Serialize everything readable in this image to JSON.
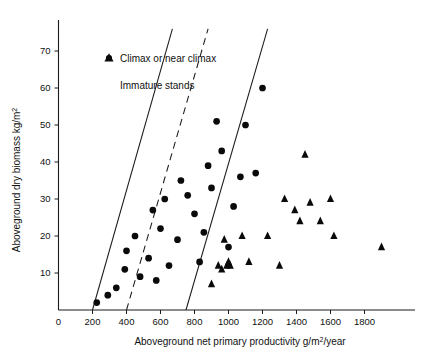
{
  "chart_data": {
    "type": "scatter",
    "title": "",
    "xlabel": "Aboveground net primary productivity g/m2/year",
    "xlabel_parts": {
      "pre": "Aboveground net primary productivity g/m",
      "sup": "2",
      "post": "/year"
    },
    "ylabel": "Aboveground dry biomass kg/m2",
    "ylabel_parts": {
      "pre": "Aboveground dry biomass kg/m",
      "sup": "2"
    },
    "xlim": [
      0,
      2000
    ],
    "ylim": [
      0,
      76
    ],
    "grid": false,
    "x_ticks": [
      0,
      200,
      400,
      600,
      800,
      1000,
      1200,
      1400,
      1600,
      1800
    ],
    "x_tick_labels": [
      "0",
      "200",
      "400",
      "600",
      "800",
      "1000",
      "1200",
      "1400",
      "1600",
      "1800"
    ],
    "y_ticks": [
      10,
      20,
      30,
      40,
      50,
      60,
      70
    ],
    "y_tick_labels": [
      "10",
      "20",
      "30",
      "40",
      "50",
      "60",
      "70"
    ],
    "legend_position": "upper-left-inside",
    "series": [
      {
        "name": "Climax or near climax",
        "marker": "circle",
        "color": "#0a0a0a",
        "points": [
          [
            225,
            2
          ],
          [
            290,
            4
          ],
          [
            340,
            6
          ],
          [
            390,
            11
          ],
          [
            400,
            16
          ],
          [
            450,
            20
          ],
          [
            480,
            9
          ],
          [
            530,
            14
          ],
          [
            555,
            27
          ],
          [
            575,
            8
          ],
          [
            600,
            22
          ],
          [
            625,
            30
          ],
          [
            650,
            12
          ],
          [
            700,
            19
          ],
          [
            720,
            35
          ],
          [
            760,
            31
          ],
          [
            800,
            26
          ],
          [
            830,
            13
          ],
          [
            855,
            21
          ],
          [
            880,
            39
          ],
          [
            900,
            33
          ],
          [
            930,
            51
          ],
          [
            960,
            43
          ],
          [
            1000,
            17
          ],
          [
            1030,
            28
          ],
          [
            1070,
            36
          ],
          [
            1100,
            50
          ],
          [
            1160,
            37
          ],
          [
            1200,
            60
          ]
        ]
      },
      {
        "name": "Immature stands",
        "marker": "triangle",
        "color": "#0a0a0a",
        "points": [
          [
            900,
            7
          ],
          [
            940,
            12
          ],
          [
            960,
            11
          ],
          [
            975,
            19
          ],
          [
            990,
            12
          ],
          [
            1000,
            13
          ],
          [
            1010,
            12
          ],
          [
            1080,
            20
          ],
          [
            1120,
            13
          ],
          [
            1230,
            20
          ],
          [
            1300,
            12
          ],
          [
            1330,
            30
          ],
          [
            1390,
            27
          ],
          [
            1420,
            24
          ],
          [
            1450,
            42
          ],
          [
            1480,
            29
          ],
          [
            1540,
            24
          ],
          [
            1600,
            30
          ],
          [
            1620,
            20
          ],
          [
            1900,
            17
          ]
        ]
      }
    ],
    "reference_lines": [
      {
        "name": "upper-solid",
        "style": "solid",
        "x_intercept": 200,
        "points": [
          [
            200,
            0
          ],
          [
            670,
            76
          ]
        ]
      },
      {
        "name": "middle-dashed",
        "style": "dashed",
        "x_intercept": 400,
        "points": [
          [
            400,
            0
          ],
          [
            880,
            76
          ]
        ]
      },
      {
        "name": "lower-solid",
        "style": "solid",
        "x_intercept": 750,
        "points": [
          [
            750,
            0
          ],
          [
            1230,
            76
          ]
        ]
      }
    ]
  },
  "legend": {
    "items": [
      {
        "marker": "circle",
        "label": "Climax or near climax"
      },
      {
        "marker": "triangle",
        "label": "Immature stands"
      }
    ]
  }
}
